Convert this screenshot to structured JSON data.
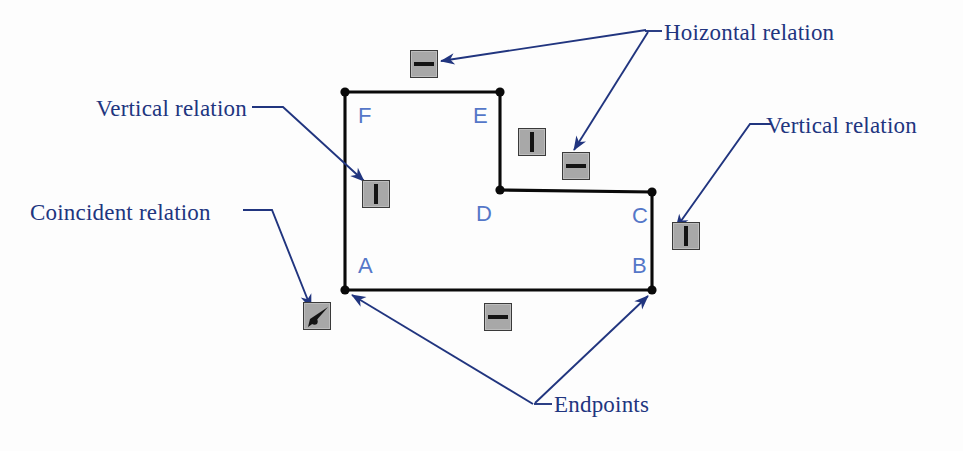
{
  "figure": {
    "background_color": "#fdfdfd",
    "sketch_line_color": "#000000",
    "annotation_color": "#21357f",
    "vertex_label_color": "#5577c8",
    "icon_fill_color": "#a8a8a8",
    "icon_mark_color": "#141414"
  },
  "sketch": {
    "name": "l-shaped-profile",
    "vertices": [
      {
        "id": "A",
        "label": "A",
        "x": 345,
        "y": 290,
        "label_x": 358,
        "label_y": 253
      },
      {
        "id": "B",
        "label": "B",
        "x": 652,
        "y": 290,
        "label_x": 632,
        "label_y": 253
      },
      {
        "id": "C",
        "label": "C",
        "x": 652,
        "y": 192,
        "label_x": 632,
        "label_y": 203
      },
      {
        "id": "D",
        "label": "D",
        "x": 500,
        "y": 190,
        "label_x": 476,
        "label_y": 201
      },
      {
        "id": "E",
        "label": "E",
        "x": 500,
        "y": 92,
        "label_x": 473,
        "label_y": 103
      },
      {
        "id": "F",
        "label": "F",
        "x": 345,
        "y": 92,
        "label_x": 358,
        "label_y": 103
      }
    ]
  },
  "relation_icons": [
    {
      "name": "horizontal-relation-icon-top",
      "type": "horizontal",
      "x": 410,
      "y": 50
    },
    {
      "name": "vertical-relation-icon-left",
      "type": "vertical",
      "x": 362,
      "y": 180
    },
    {
      "name": "vertical-relation-icon-middle",
      "type": "vertical",
      "x": 518,
      "y": 128
    },
    {
      "name": "horizontal-relation-icon-middle",
      "type": "horizontal",
      "x": 562,
      "y": 152
    },
    {
      "name": "vertical-relation-icon-right",
      "type": "vertical",
      "x": 672,
      "y": 222
    },
    {
      "name": "horizontal-relation-icon-bottom",
      "type": "horizontal",
      "x": 484,
      "y": 303
    },
    {
      "name": "coincident-relation-icon",
      "type": "coincident",
      "x": 303,
      "y": 302
    }
  ],
  "callouts": [
    {
      "name": "hoizontal-relation-callout",
      "label": "Hoizontal relation",
      "text_x": 664,
      "text_y": 20
    },
    {
      "name": "vertical-relation-callout-left",
      "label": "Vertical relation",
      "text_x": 96,
      "text_y": 96
    },
    {
      "name": "vertical-relation-callout-right",
      "label": "Vertical relation",
      "text_x": 766,
      "text_y": 113
    },
    {
      "name": "coincident-relation-callout",
      "label": "Coincident relation",
      "text_x": 30,
      "text_y": 200
    },
    {
      "name": "endpoints-callout",
      "label": "Endpoints",
      "text_x": 554,
      "text_y": 392
    }
  ]
}
